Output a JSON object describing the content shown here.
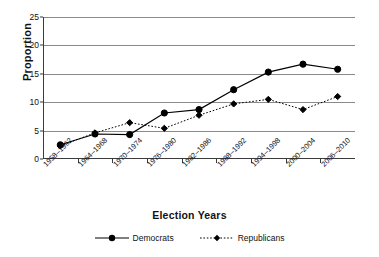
{
  "chart_data": {
    "type": "line",
    "title": "",
    "xlabel": "Election Years",
    "ylabel": "Proportion",
    "ylim": [
      0,
      25
    ],
    "yticks": [
      0,
      5,
      10,
      15,
      20,
      25
    ],
    "grid": true,
    "legend_position": "bottom",
    "categories": [
      "1958–1962",
      "1964–1968",
      "1970–1974",
      "1976–1980",
      "1982–1986",
      "1988–1992",
      "1994–1998",
      "2000–2004",
      "2006–2010"
    ],
    "series": [
      {
        "name": "Democrats",
        "marker": "circle",
        "linestyle": "solid",
        "color": "#000000",
        "values": [
          2.5,
          4.4,
          4.3,
          8.1,
          8.7,
          12.2,
          15.3,
          16.7,
          15.8
        ]
      },
      {
        "name": "Republicans",
        "marker": "diamond",
        "linestyle": "dotted",
        "color": "#000000",
        "values": [
          2.3,
          4.6,
          6.4,
          5.4,
          7.7,
          9.7,
          10.5,
          8.7,
          11.0
        ]
      }
    ]
  },
  "axes": {
    "y_title": "Proportion",
    "x_title": "Election Years",
    "y_tick_labels": [
      "0",
      "5",
      "10",
      "15",
      "20",
      "25"
    ]
  },
  "legend": {
    "items": [
      {
        "label": "Democrats",
        "marker": "circle-marker",
        "linestyle": "solid"
      },
      {
        "label": "Republicans",
        "marker": "diamond-marker",
        "linestyle": "dotted"
      }
    ]
  }
}
